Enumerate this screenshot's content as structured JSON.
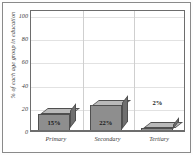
{
  "chart_data": {
    "type": "bar",
    "title": "",
    "subtitle": "",
    "xlabel": "",
    "ylabel": "% of each age group in education",
    "categories": [
      "Primary",
      "Secondary",
      "Tertiary"
    ],
    "values": [
      15,
      22,
      2
    ],
    "data_labels": [
      "15%",
      "22%",
      "2%"
    ],
    "ylim": [
      0,
      105
    ],
    "ytick_values": [
      0,
      20,
      40,
      60,
      80,
      100
    ],
    "ytick_labels": [
      "0",
      "20",
      "40",
      "60",
      "80",
      "100"
    ],
    "grid": {
      "horizontal": true,
      "vertical": true
    },
    "legend": {
      "visible": false,
      "position": "none"
    },
    "style": {
      "three_d": true,
      "bar_front_color": "#8e8e8e",
      "bar_top_color": "#b9b9b9",
      "bar_side_color": "#6f6f6f",
      "bar_edge_color": "#4f4f4f",
      "plot_background": "#ffffff",
      "frame_color": "#8a8a8a",
      "axis_color": "#6d6d6d",
      "gridline_color": "#e2e2e2",
      "text_color": "#3a3a3a"
    }
  }
}
